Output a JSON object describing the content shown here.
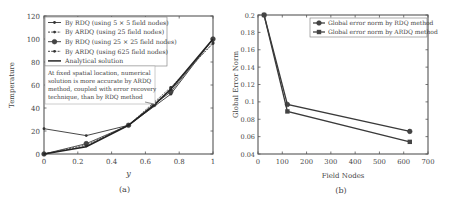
{
  "chart_data": [
    {
      "panel_label": "(a)",
      "type": "line",
      "title": "",
      "xlabel": "y",
      "ylabel": "Temperature",
      "xlim": [
        0,
        1
      ],
      "ylim": [
        0,
        120
      ],
      "xticks": [
        "0",
        "0.2",
        "0.4",
        "0.6",
        "0.8",
        "1"
      ],
      "yticks": [
        "0",
        "20",
        "40",
        "60",
        "80",
        "100",
        "120"
      ],
      "grid": false,
      "legend_position": "upper left",
      "series": [
        {
          "name": "By RDQ (using 5 × 5 field nodes)",
          "x": [
            0,
            0.25,
            0.5,
            0.75,
            1
          ],
          "y": [
            22,
            16,
            25,
            52,
            100
          ],
          "marker": "dot",
          "dash": "solid"
        },
        {
          "name": "By ARDQ (using 25 field nodes)",
          "x": [
            0,
            0.25,
            0.5,
            0.75,
            1
          ],
          "y": [
            0,
            8,
            25,
            58,
            96
          ],
          "marker": "dot",
          "dash": "dashed"
        },
        {
          "name": "By RDQ (using 25 × 25 field nodes)",
          "x": [
            0,
            0.25,
            0.5,
            0.65,
            0.75,
            1
          ],
          "y": [
            0,
            9,
            25,
            43,
            54,
            100
          ],
          "marker": "circle",
          "dash": "solid"
        },
        {
          "name": "By ARDQ (using 625 field nodes)",
          "x": [
            0,
            0.25,
            0.5,
            0.65,
            0.75,
            1
          ],
          "y": [
            0,
            7,
            25,
            44,
            56,
            97
          ],
          "marker": "dot",
          "dash": "dashed"
        },
        {
          "name": "Analytical solution",
          "x": [
            0,
            0.25,
            0.5,
            0.65,
            0.75,
            1
          ],
          "y": [
            0,
            6.25,
            25,
            42.25,
            56.25,
            100
          ],
          "marker": "none",
          "dash": "solid"
        }
      ],
      "annotation": "At fixed spatial location, numerical solution is more accurate by ARDQ method, coupled with error recovery technique, than by RDQ method",
      "annotation_lines": [
        "At fixed spatial location, numerical",
        "solution is more accurate by ARDQ",
        "method, coupled with error recovery",
        "technique, than by RDQ method"
      ]
    },
    {
      "panel_label": "(b)",
      "type": "line",
      "title": "",
      "xlabel": "Field Nodes",
      "ylabel": "Global Error Norm",
      "xlim": [
        0,
        700
      ],
      "ylim": [
        0.04,
        0.2
      ],
      "xticks": [
        "0",
        "100",
        "200",
        "300",
        "400",
        "500",
        "600",
        "700"
      ],
      "yticks": [
        "0.04",
        "0.06",
        "0.08",
        "0.1",
        "0.12",
        "0.14",
        "0.16",
        "0.18",
        "0.2"
      ],
      "grid": false,
      "legend_position": "upper right",
      "series": [
        {
          "name": "Global error norm by RDQ method",
          "x": [
            25,
            121,
            625
          ],
          "y": [
            0.2,
            0.097,
            0.066
          ],
          "marker": "circle"
        },
        {
          "name": "Global error norm by ARDQ method",
          "x": [
            25,
            121,
            625
          ],
          "y": [
            0.2,
            0.089,
            0.054
          ],
          "marker": "square"
        }
      ]
    }
  ]
}
